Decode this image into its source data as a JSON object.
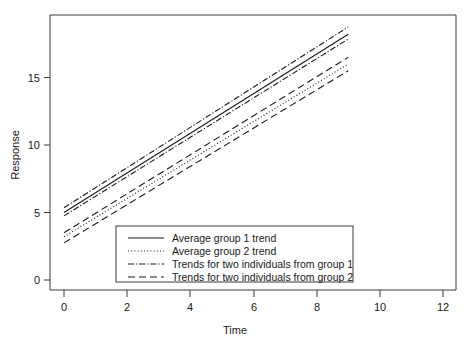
{
  "chart_data": {
    "type": "line",
    "title": "",
    "xlabel": "Time",
    "ylabel": "Response",
    "xlim": [
      -0.5,
      12.6
    ],
    "ylim": [
      -1.0,
      19.2
    ],
    "xticks": [
      0,
      2,
      4,
      6,
      8,
      10,
      12
    ],
    "yticks": [
      0,
      5,
      10,
      15
    ],
    "xtick_labels": [
      "0",
      "2",
      "4",
      "6",
      "8",
      "10",
      "12"
    ],
    "ytick_labels": [
      "0",
      "5",
      "10",
      "15"
    ],
    "grid": false,
    "legend_position": "lower-center-inside",
    "x": [
      0,
      9
    ],
    "series": [
      {
        "name": "Average group 1 trend",
        "style": "solid",
        "values": [
          5.0,
          18.2
        ],
        "intercept": 5.0,
        "slope": 1.467
      },
      {
        "name": "Average group 2 trend",
        "style": "dotted",
        "values": [
          3.2,
          16.0
        ],
        "intercept": 3.2,
        "slope": 1.422
      },
      {
        "name": "Trends for two individuals from group 1",
        "style": "dash-dot",
        "values": [
          5.35,
          18.75
        ],
        "intercept": 5.35,
        "slope": 1.489
      },
      {
        "name": "Trends for two individuals from group 1",
        "style": "dash-dot",
        "values": [
          4.75,
          17.85
        ],
        "intercept": 4.75,
        "slope": 1.456
      },
      {
        "name": "Trends for two individuals from group 2",
        "style": "dashed",
        "values": [
          3.5,
          16.5
        ],
        "intercept": 3.5,
        "slope": 1.444
      },
      {
        "name": "Trends for two individuals from group 2",
        "style": "dashed",
        "values": [
          2.75,
          15.5
        ],
        "intercept": 2.75,
        "slope": 1.417
      }
    ],
    "legend_entries": [
      {
        "label": "Average group 1 trend",
        "style": "solid"
      },
      {
        "label": "Average group 2 trend",
        "style": "dotted"
      },
      {
        "label": "Trends for two individuals from group 1",
        "style": "dash-dot"
      },
      {
        "label": "Trends for two individuals from group 2",
        "style": "dashed"
      }
    ]
  },
  "axes": {
    "x_title": "Time",
    "y_title": "Response"
  },
  "colors": {
    "line": "#1a1a1a",
    "frame": "#3a3a3a",
    "background": "#ffffff"
  }
}
